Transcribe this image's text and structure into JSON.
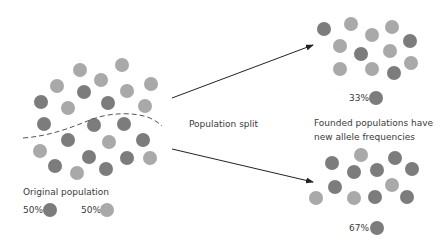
{
  "colors": {
    "allele_dark": "#7c7c7c",
    "allele_light": "#a9a9a9",
    "arrow": "#222222",
    "dashed_line": "#555555",
    "text": "#3a3a3a"
  },
  "labels": {
    "split": "Population split",
    "founded_line1": "Founded populations have",
    "founded_line2": "new allele frequencies",
    "original": "Original population"
  },
  "legend": {
    "original_dark_pct": "50%",
    "original_light_pct": "50%",
    "top_dark_pct": "33%",
    "bottom_dark_pct": "67%"
  },
  "populations": {
    "original": [
      {
        "x": 80,
        "y": 70,
        "t": "light"
      },
      {
        "x": 122,
        "y": 65,
        "t": "light"
      },
      {
        "x": 57,
        "y": 86,
        "t": "light"
      },
      {
        "x": 101,
        "y": 80,
        "t": "light"
      },
      {
        "x": 127,
        "y": 91,
        "t": "light"
      },
      {
        "x": 151,
        "y": 84,
        "t": "light"
      },
      {
        "x": 84,
        "y": 92,
        "t": "dark"
      },
      {
        "x": 41,
        "y": 102,
        "t": "dark"
      },
      {
        "x": 68,
        "y": 108,
        "t": "light"
      },
      {
        "x": 108,
        "y": 103,
        "t": "dark"
      },
      {
        "x": 145,
        "y": 106,
        "t": "light"
      },
      {
        "x": 44,
        "y": 124,
        "t": "dark"
      },
      {
        "x": 94,
        "y": 125,
        "t": "dark"
      },
      {
        "x": 124,
        "y": 124,
        "t": "dark"
      },
      {
        "x": 68,
        "y": 140,
        "t": "dark"
      },
      {
        "x": 109,
        "y": 142,
        "t": "light"
      },
      {
        "x": 143,
        "y": 140,
        "t": "dark"
      },
      {
        "x": 40,
        "y": 151,
        "t": "light"
      },
      {
        "x": 89,
        "y": 157,
        "t": "dark"
      },
      {
        "x": 127,
        "y": 158,
        "t": "dark"
      },
      {
        "x": 150,
        "y": 158,
        "t": "light"
      },
      {
        "x": 55,
        "y": 166,
        "t": "dark"
      },
      {
        "x": 77,
        "y": 173,
        "t": "light"
      },
      {
        "x": 106,
        "y": 169,
        "t": "dark"
      }
    ],
    "top": [
      {
        "x": 324,
        "y": 29,
        "t": "dark"
      },
      {
        "x": 351,
        "y": 24,
        "t": "light"
      },
      {
        "x": 372,
        "y": 35,
        "t": "light"
      },
      {
        "x": 392,
        "y": 27,
        "t": "light"
      },
      {
        "x": 340,
        "y": 46,
        "t": "light"
      },
      {
        "x": 361,
        "y": 54,
        "t": "dark"
      },
      {
        "x": 390,
        "y": 51,
        "t": "light"
      },
      {
        "x": 410,
        "y": 41,
        "t": "dark"
      },
      {
        "x": 340,
        "y": 69,
        "t": "light"
      },
      {
        "x": 372,
        "y": 69,
        "t": "light"
      },
      {
        "x": 394,
        "y": 73,
        "t": "dark"
      },
      {
        "x": 411,
        "y": 63,
        "t": "light"
      }
    ],
    "bottom": [
      {
        "x": 361,
        "y": 155,
        "t": "light"
      },
      {
        "x": 395,
        "y": 158,
        "t": "dark"
      },
      {
        "x": 332,
        "y": 163,
        "t": "dark"
      },
      {
        "x": 354,
        "y": 172,
        "t": "dark"
      },
      {
        "x": 377,
        "y": 170,
        "t": "dark"
      },
      {
        "x": 412,
        "y": 169,
        "t": "dark"
      },
      {
        "x": 335,
        "y": 187,
        "t": "dark"
      },
      {
        "x": 392,
        "y": 185,
        "t": "light"
      },
      {
        "x": 316,
        "y": 198,
        "t": "light"
      },
      {
        "x": 354,
        "y": 198,
        "t": "light"
      },
      {
        "x": 375,
        "y": 197,
        "t": "dark"
      },
      {
        "x": 407,
        "y": 197,
        "t": "dark"
      }
    ]
  },
  "arrows": [
    {
      "name": "arrow-to-top-population",
      "x1": 172,
      "y1": 98,
      "x2": 313,
      "y2": 45
    },
    {
      "name": "arrow-to-bottom-population",
      "x1": 172,
      "y1": 149,
      "x2": 313,
      "y2": 182
    }
  ]
}
